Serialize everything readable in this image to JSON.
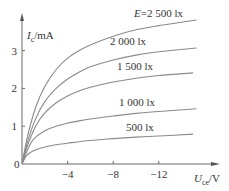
{
  "chart_data": {
    "type": "line",
    "title": "",
    "xlabel": "U_ce/V",
    "ylabel": "I_c/mA",
    "xlabel_main": "U",
    "xlabel_sub": "ce",
    "xlabel_unit": "/V",
    "ylabel_main": "I",
    "ylabel_sub": "c",
    "ylabel_unit": "/mA",
    "xlim": [
      0,
      -15.3
    ],
    "ylim": [
      0,
      3.9
    ],
    "grid": false,
    "x_ticks": [
      {
        "value": -4,
        "label": "−4"
      },
      {
        "value": -8,
        "label": "−8"
      },
      {
        "value": -12,
        "label": "−12"
      }
    ],
    "y_ticks": [
      {
        "value": 1,
        "label": "1"
      },
      {
        "value": 2,
        "label": "2"
      },
      {
        "value": 3,
        "label": "3"
      }
    ],
    "origin_label": "0",
    "series": [
      {
        "name": "E=2 500 lx",
        "x": [
          0,
          -0.5,
          -1.2,
          -2,
          -3,
          -4,
          -5,
          -6,
          -8,
          -10,
          -12,
          -15.3
        ],
        "y": [
          0,
          0.75,
          1.5,
          2.05,
          2.5,
          2.8,
          3.0,
          3.15,
          3.38,
          3.55,
          3.66,
          3.81
        ]
      },
      {
        "name": "2 000 lx",
        "x": [
          0,
          -0.5,
          -1.2,
          -2,
          -3,
          -4,
          -5,
          -6,
          -8,
          -10,
          -12,
          -15.3
        ],
        "y": [
          0,
          0.6,
          1.2,
          1.65,
          2.0,
          2.25,
          2.43,
          2.57,
          2.75,
          2.88,
          2.97,
          3.07
        ]
      },
      {
        "name": "1 500 lx",
        "x": [
          0,
          -0.5,
          -1.2,
          -2,
          -3,
          -4,
          -5,
          -6,
          -8,
          -10,
          -12,
          -15
        ],
        "y": [
          0,
          0.5,
          1.0,
          1.35,
          1.62,
          1.8,
          1.93,
          2.03,
          2.17,
          2.27,
          2.34,
          2.41
        ]
      },
      {
        "name": "1 000 lx",
        "x": [
          0,
          -0.5,
          -1,
          -2,
          -3,
          -4,
          -5,
          -6,
          -8,
          -10,
          -12,
          -15.3
        ],
        "y": [
          0,
          0.38,
          0.65,
          0.88,
          1.0,
          1.08,
          1.14,
          1.19,
          1.27,
          1.34,
          1.39,
          1.46
        ]
      },
      {
        "name": "500 lx",
        "x": [
          0,
          -0.4,
          -1,
          -2,
          -3,
          -4,
          -5,
          -6,
          -8,
          -10,
          -12,
          -15
        ],
        "y": [
          0,
          0.22,
          0.35,
          0.45,
          0.51,
          0.55,
          0.59,
          0.62,
          0.67,
          0.71,
          0.74,
          0.79
        ]
      }
    ],
    "annotations": [
      {
        "text": "E=2 500 lx",
        "series": 0
      },
      {
        "text": "2 000 lx",
        "series": 1
      },
      {
        "text": "1 500 lx",
        "series": 2
      },
      {
        "text": "1 000 lx",
        "series": 3
      },
      {
        "text": "500 lx",
        "series": 4
      }
    ],
    "legend": "inline-labels-above-curves-right"
  }
}
